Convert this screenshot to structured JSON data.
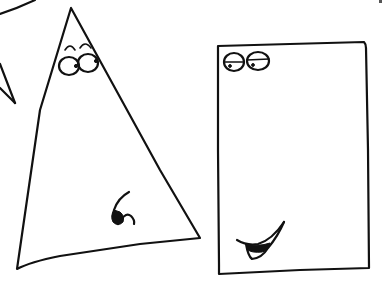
{
  "scene": {
    "title": "",
    "background": "#ffffff",
    "ink_color": "#111111",
    "description": "Hand-drawn sketch of a triangle character and a rectangle character with cartoon faces",
    "characters": [
      {
        "name": "triangle",
        "shape": "triangle",
        "features": [
          "raised-eyebrows",
          "round-eyes-looking-right",
          "curled-nose-or-mouth"
        ]
      },
      {
        "name": "rectangle",
        "shape": "rectangle",
        "features": [
          "half-lidded-eyes",
          "open-smiling-mouth"
        ]
      }
    ],
    "partial_shapes": [
      {
        "name": "partial-star-shape",
        "position": "top-left-edge"
      }
    ]
  }
}
